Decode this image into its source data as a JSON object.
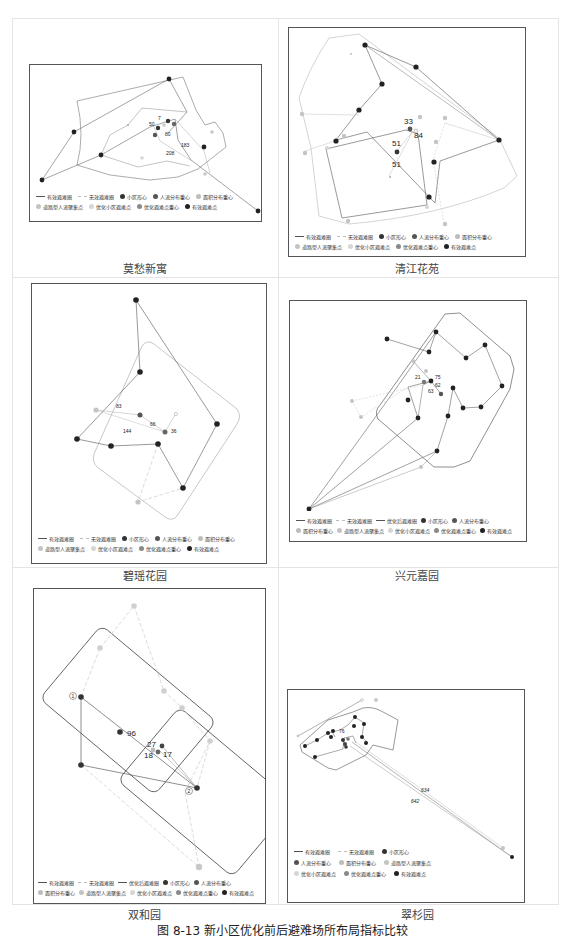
{
  "figure": {
    "caption": "图 8-13  新小区优化前后避难场所布局指标比较"
  },
  "colors": {
    "effective_line": "#555555",
    "ineffective_line": "#bbbbbb",
    "boundary_effective": "#444444",
    "boundary_light": "#c8c8c8",
    "community_centroid": "#333333",
    "flow_center": "#555555",
    "area_center": "#bdbdbd",
    "road_gathering": "#c4c4c4",
    "optimized_point": "#d6d6d6",
    "optimized_center": "#8a8a8a",
    "effective_point": "#222222"
  },
  "legend_labels": {
    "effective_circle": "有效避难圈",
    "ineffective_circle": "无效避难圈",
    "optimized_circle": "优化后避难圈",
    "community_centroid": "小区形心",
    "flow_center": "人流分布重心",
    "area_center": "面积分布重心",
    "road_gathering": "道路型人流聚集点",
    "optimized_point": "优化小区避难点",
    "optimized_center": "优化避难点重心",
    "effective_point": "有效避难点"
  },
  "panels": [
    {
      "id": "mochou",
      "title": "莫愁新寓",
      "distance_labels": [
        "50",
        "7",
        "80",
        "183",
        "208"
      ]
    },
    {
      "id": "qingjiang",
      "title": "清江花苑",
      "distance_labels": [
        "33",
        "84",
        "51",
        "51"
      ]
    },
    {
      "id": "biyao",
      "title": "碧瑶花园",
      "distance_labels": [
        "83",
        "66",
        "144",
        "36"
      ]
    },
    {
      "id": "xingyuan",
      "title": "兴元嘉园",
      "distance_labels": [
        "21",
        "75",
        "62",
        "63"
      ]
    },
    {
      "id": "shuanghe",
      "title": "双和园",
      "distance_labels": [
        "96",
        "27",
        "17",
        "18"
      ],
      "circle_markers": [
        "1",
        "2"
      ]
    },
    {
      "id": "cuishan",
      "title": "翠杉园",
      "distance_labels": [
        "634",
        "642",
        "76"
      ]
    }
  ]
}
